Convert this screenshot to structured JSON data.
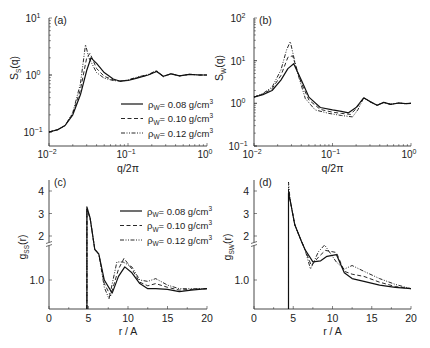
{
  "legend": [
    {
      "label": "ρ",
      "sub": "W",
      "value": "= 0.08 g/cm",
      "sup": "3",
      "style": "solid"
    },
    {
      "label": "ρ",
      "sub": "W",
      "value": "= 0.10 g/cm",
      "sup": "3",
      "style": "dashed"
    },
    {
      "label": "ρ",
      "sub": "W",
      "value": "= 0.12 g/cm",
      "sup": "3",
      "style": "dashdotdot"
    }
  ],
  "chart_data": [
    {
      "panel": "(a)",
      "type": "line",
      "xscale": "log",
      "yscale": "log",
      "xlabel": "q/2π",
      "ylabel": "S_s(q)",
      "xlim": [
        0.01,
        1
      ],
      "ylim": [
        0.1,
        10
      ],
      "xticks": [
        "10^-2",
        "10^-1",
        "10^0"
      ],
      "yticks": [
        "10^-1",
        "10^0",
        "10^1"
      ],
      "legend_position": "center-right",
      "series": [
        {
          "name": "ρW = 0.08 g/cm3",
          "x": [
            0.01,
            0.013,
            0.016,
            0.02,
            0.025,
            0.03,
            0.034,
            0.04,
            0.05,
            0.065,
            0.08,
            0.1,
            0.13,
            0.18,
            0.23,
            0.28,
            0.35,
            0.45,
            0.6,
            0.8,
            1.0
          ],
          "y": [
            0.1,
            0.11,
            0.13,
            0.2,
            0.45,
            1.2,
            2.0,
            1.6,
            1.1,
            0.85,
            0.78,
            0.8,
            0.88,
            1.0,
            1.15,
            0.95,
            1.05,
            0.97,
            1.03,
            1.0,
            1.0
          ]
        },
        {
          "name": "ρW = 0.10 g/cm3",
          "x": [
            0.01,
            0.013,
            0.016,
            0.02,
            0.025,
            0.03,
            0.033,
            0.04,
            0.05,
            0.065,
            0.08,
            0.1,
            0.13,
            0.18,
            0.23,
            0.28,
            0.35,
            0.45,
            0.6,
            0.8,
            1.0
          ],
          "y": [
            0.1,
            0.11,
            0.13,
            0.21,
            0.55,
            2.0,
            2.4,
            1.3,
            0.95,
            0.82,
            0.78,
            0.81,
            0.9,
            1.0,
            1.17,
            0.94,
            1.05,
            0.97,
            1.03,
            1.0,
            1.0
          ]
        },
        {
          "name": "ρW = 0.12 g/cm3",
          "x": [
            0.01,
            0.013,
            0.016,
            0.02,
            0.025,
            0.029,
            0.032,
            0.04,
            0.05,
            0.065,
            0.08,
            0.1,
            0.13,
            0.18,
            0.23,
            0.28,
            0.35,
            0.45,
            0.6,
            0.8,
            1.0
          ],
          "y": [
            0.1,
            0.11,
            0.13,
            0.22,
            0.7,
            3.4,
            2.0,
            1.1,
            0.88,
            0.8,
            0.78,
            0.82,
            0.92,
            1.02,
            1.2,
            0.93,
            1.05,
            0.97,
            1.03,
            1.0,
            1.0
          ]
        }
      ]
    },
    {
      "panel": "(b)",
      "type": "line",
      "xscale": "log",
      "yscale": "log",
      "xlabel": "q/2π",
      "ylabel": "S_w(q)",
      "xlim": [
        0.01,
        1
      ],
      "ylim": [
        0.1,
        100
      ],
      "xticks": [
        "10^-2",
        "10^-1",
        "10^0"
      ],
      "yticks": [
        "10^-1",
        "10^0",
        "10^1",
        "10^2"
      ],
      "series": [
        {
          "name": "ρW = 0.08 g/cm3",
          "x": [
            0.01,
            0.013,
            0.017,
            0.022,
            0.027,
            0.032,
            0.04,
            0.05,
            0.07,
            0.1,
            0.13,
            0.16,
            0.2,
            0.25,
            0.3,
            0.37,
            0.45,
            0.55,
            0.7,
            0.85,
            1.0
          ],
          "y": [
            1.4,
            1.6,
            2.0,
            3.5,
            6.5,
            8.5,
            3.5,
            1.4,
            0.8,
            0.7,
            0.65,
            0.6,
            0.8,
            1.35,
            1.1,
            0.9,
            1.05,
            0.95,
            1.02,
            0.98,
            1.0
          ]
        },
        {
          "name": "ρW = 0.10 g/cm3",
          "x": [
            0.01,
            0.013,
            0.017,
            0.022,
            0.027,
            0.031,
            0.04,
            0.05,
            0.07,
            0.1,
            0.13,
            0.17,
            0.2,
            0.25,
            0.3,
            0.37,
            0.45,
            0.55,
            0.7,
            0.85,
            1.0
          ],
          "y": [
            1.4,
            1.65,
            2.2,
            4.5,
            12,
            13,
            3.0,
            1.2,
            0.72,
            0.62,
            0.58,
            0.55,
            0.75,
            1.35,
            1.1,
            0.9,
            1.05,
            0.95,
            1.02,
            0.98,
            1.0
          ]
        },
        {
          "name": "ρW = 0.12 g/cm3",
          "x": [
            0.01,
            0.013,
            0.017,
            0.022,
            0.026,
            0.029,
            0.035,
            0.045,
            0.06,
            0.09,
            0.13,
            0.18,
            0.21,
            0.25,
            0.3,
            0.37,
            0.45,
            0.55,
            0.7,
            0.85,
            1.0
          ],
          "y": [
            1.4,
            1.7,
            2.4,
            6.0,
            18,
            28,
            6.0,
            1.3,
            0.7,
            0.58,
            0.52,
            0.48,
            0.7,
            1.35,
            1.1,
            0.9,
            1.05,
            0.95,
            1.02,
            0.98,
            1.0
          ]
        }
      ]
    },
    {
      "panel": "(c)",
      "type": "line",
      "xlabel": "r / A",
      "ylabel": "g_ss(r)",
      "xlim": [
        0,
        20
      ],
      "ylim": [
        0.6,
        4.4
      ],
      "xticks": [
        "0",
        "5",
        "10",
        "15",
        "20"
      ],
      "yticks": [
        "1.0",
        "2",
        "3",
        "4"
      ],
      "axis_break": "between 1.0 and 2",
      "legend_position": "upper-right",
      "series": [
        {
          "name": "ρW = 0.08 g/cm3",
          "x": [
            4.8,
            4.8,
            5.2,
            5.8,
            6.3,
            7.0,
            8.0,
            8.8,
            9.6,
            10.5,
            11.5,
            12.5,
            13.5,
            15,
            16.5,
            18,
            20
          ],
          "y": [
            0,
            3.3,
            2.8,
            1.7,
            1.6,
            1.0,
            0.82,
            1.05,
            1.18,
            1.1,
            0.95,
            0.88,
            0.88,
            0.87,
            0.84,
            0.86,
            0.88
          ]
        },
        {
          "name": "ρW = 0.10 g/cm3",
          "x": [
            4.8,
            4.8,
            5.2,
            5.8,
            6.3,
            7.0,
            7.8,
            8.8,
            9.5,
            10.5,
            11.5,
            12.5,
            13.5,
            15,
            16.5,
            18,
            20
          ],
          "y": [
            0,
            3.2,
            2.8,
            1.7,
            1.6,
            0.95,
            0.78,
            1.15,
            1.3,
            1.15,
            0.97,
            0.92,
            0.95,
            0.9,
            0.86,
            0.87,
            0.88
          ]
        },
        {
          "name": "ρW = 0.12 g/cm3",
          "x": [
            4.8,
            4.8,
            5.2,
            5.8,
            6.3,
            7.0,
            7.6,
            8.6,
            9.4,
            10.5,
            11.5,
            12.5,
            13.5,
            15,
            16.5,
            18,
            20
          ],
          "y": [
            0,
            3.1,
            2.8,
            1.7,
            1.6,
            0.9,
            0.74,
            1.25,
            1.42,
            1.18,
            1.0,
            0.98,
            1.02,
            0.93,
            0.88,
            0.88,
            0.88
          ]
        }
      ]
    },
    {
      "panel": "(d)",
      "type": "line",
      "xlabel": "r / A",
      "ylabel": "g_sw(r)",
      "xlim": [
        0,
        20
      ],
      "ylim": [
        0.6,
        4.4
      ],
      "xticks": [
        "0",
        "5",
        "10",
        "15",
        "20"
      ],
      "yticks": [
        "1.0",
        "2",
        "3",
        "4"
      ],
      "axis_break": "between 1.0 and 2",
      "series": [
        {
          "name": "ρW = 0.08 g/cm3",
          "x": [
            4.4,
            4.4,
            4.6,
            5.2,
            6.0,
            6.5,
            7.5,
            8.5,
            9.3,
            10.5,
            11.5,
            12.5,
            14,
            16,
            18,
            20
          ],
          "y": [
            0,
            3.9,
            3.6,
            2.5,
            1.9,
            1.7,
            1.25,
            1.45,
            1.55,
            1.35,
            1.1,
            1.02,
            0.98,
            0.93,
            0.9,
            0.88
          ]
        },
        {
          "name": "ρW = 0.10 g/cm3",
          "x": [
            4.4,
            4.4,
            4.6,
            5.2,
            6.0,
            6.5,
            7.3,
            8.3,
            9.1,
            10.5,
            11.5,
            12.5,
            14,
            16,
            18,
            20
          ],
          "y": [
            0,
            4.1,
            3.6,
            2.5,
            1.9,
            1.7,
            1.2,
            1.55,
            1.68,
            1.38,
            1.12,
            1.08,
            1.05,
            0.97,
            0.91,
            0.88
          ]
        },
        {
          "name": "ρW = 0.12 g/cm3",
          "x": [
            4.4,
            4.4,
            4.6,
            5.2,
            6.0,
            6.5,
            7.2,
            8.2,
            9.0,
            10.5,
            11.5,
            12.5,
            14,
            16,
            18,
            20
          ],
          "y": [
            0,
            4.4,
            3.6,
            2.5,
            1.9,
            1.7,
            1.15,
            1.65,
            1.8,
            1.42,
            1.15,
            1.2,
            1.12,
            1.02,
            0.94,
            0.88
          ]
        }
      ]
    }
  ],
  "panels": [
    {
      "tag": "(a)",
      "ylabel_main": "S",
      "ylabel_sub": "S",
      "ylabel_tail": "(q)",
      "xlabel": "q/2π"
    },
    {
      "tag": "(b)",
      "ylabel_main": "S",
      "ylabel_sub": "W",
      "ylabel_tail": "(q)",
      "xlabel": "q/2π"
    },
    {
      "tag": "(c)",
      "ylabel_main": "g",
      "ylabel_sub": "SS",
      "ylabel_tail": "(r)",
      "xlabel": "r / A"
    },
    {
      "tag": "(d)",
      "ylabel_main": "g",
      "ylabel_sub": "SW",
      "ylabel_tail": "(r)",
      "xlabel": "r / A"
    }
  ],
  "ticks": {
    "log_x": [
      {
        "base": "10",
        "exp": "−2"
      },
      {
        "base": "10",
        "exp": "−1"
      },
      {
        "base": "10",
        "exp": "0"
      }
    ],
    "log_y_a": [
      {
        "base": "10",
        "exp": "−1"
      },
      {
        "base": "10",
        "exp": "0"
      },
      {
        "base": "10",
        "exp": "1"
      }
    ],
    "log_y_b": [
      {
        "base": "10",
        "exp": "−1"
      },
      {
        "base": "10",
        "exp": "0"
      },
      {
        "base": "10",
        "exp": "1"
      },
      {
        "base": "10",
        "exp": "2"
      }
    ],
    "lin_x": [
      "0",
      "5",
      "10",
      "15",
      "20"
    ],
    "lin_y": [
      "1.0",
      "2",
      "3",
      "4"
    ]
  }
}
